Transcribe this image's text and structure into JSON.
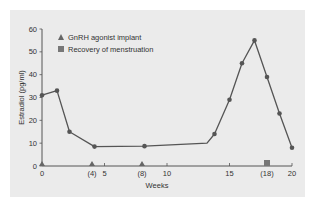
{
  "chart_data": {
    "type": "line",
    "title": "",
    "xlabel": "Weeks",
    "ylabel": "Estradiol (pg/ml)",
    "xlim": [
      0,
      20
    ],
    "ylim": [
      0,
      60
    ],
    "grid": false,
    "x_ticks": [
      {
        "value": 0,
        "label": "0"
      },
      {
        "value": 4,
        "label": "(4)"
      },
      {
        "value": 5,
        "label": "5"
      },
      {
        "value": 8,
        "label": "(8)"
      },
      {
        "value": 10,
        "label": "10"
      },
      {
        "value": 15,
        "label": "15"
      },
      {
        "value": 18,
        "label": "(18)"
      },
      {
        "value": 20,
        "label": "20"
      }
    ],
    "y_ticks": [
      0,
      10,
      20,
      30,
      40,
      50,
      60
    ],
    "series": [
      {
        "name": "Estradiol",
        "color": "#555555",
        "points": [
          {
            "x": 0,
            "y": 31,
            "marker": true
          },
          {
            "x": 1.2,
            "y": 33,
            "marker": true
          },
          {
            "x": 2.2,
            "y": 15,
            "marker": true
          },
          {
            "x": 4.2,
            "y": 8.5,
            "marker": true
          },
          {
            "x": 8.2,
            "y": 8.7,
            "marker": true
          },
          {
            "x": 13.2,
            "y": 10,
            "marker": false
          },
          {
            "x": 13.8,
            "y": 14,
            "marker": true
          },
          {
            "x": 15,
            "y": 29,
            "marker": true
          },
          {
            "x": 16,
            "y": 45,
            "marker": true
          },
          {
            "x": 17,
            "y": 55,
            "marker": true
          },
          {
            "x": 18,
            "y": 39,
            "marker": true
          },
          {
            "x": 19,
            "y": 23,
            "marker": true
          },
          {
            "x": 20,
            "y": 8,
            "marker": true
          }
        ]
      }
    ],
    "event_markers": [
      {
        "type": "triangle",
        "legend": "GnRH agonist implant",
        "x": [
          0,
          4,
          8
        ]
      },
      {
        "type": "square",
        "legend": "Recovery of menstruation",
        "x": [
          18
        ]
      }
    ],
    "legend": {
      "placement": "top-left",
      "entries": [
        {
          "symbol": "triangle",
          "label": "GnRH agonist implant"
        },
        {
          "symbol": "square",
          "label": "Recovery of menstruation"
        }
      ]
    }
  }
}
